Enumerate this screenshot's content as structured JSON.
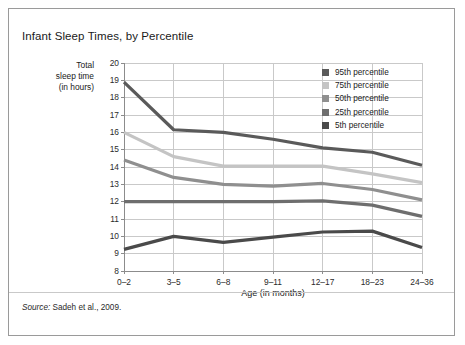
{
  "figure": {
    "title": "Infant Sleep Times, by Percentile",
    "source_label": "Source:",
    "source_text": " Sadeh et al., 2009."
  },
  "axes": {
    "y_title_lines": [
      "Total",
      "sleep time",
      "(in hours)"
    ],
    "x_title": "Age (in months)",
    "y_ticks": [
      "20",
      "19",
      "18",
      "17",
      "16",
      "15",
      "14",
      "13",
      "12",
      "11",
      "10",
      "9",
      "8"
    ],
    "x_ticks": [
      "0–2",
      "3–5",
      "6–8",
      "9–11",
      "12–17",
      "18–23",
      "24–36"
    ]
  },
  "colors": {
    "frame": "#9a9a9a",
    "grid": "#c9c9c9",
    "axis": "#8c8c8c",
    "text": "#1a1a1a",
    "p95": "#5a5a5a",
    "p75": "#c4c4c4",
    "p50": "#8f8f8f",
    "p25": "#6e6e6e",
    "p5": "#4a4a4a"
  },
  "chart_data": {
    "type": "line",
    "title": "Infant Sleep Times, by Percentile",
    "xlabel": "Age (in months)",
    "ylabel": "Total sleep time (in hours)",
    "categories": [
      "0–2",
      "3–5",
      "6–8",
      "9–11",
      "12–17",
      "18–23",
      "24–36"
    ],
    "ylim": [
      8,
      20
    ],
    "ytick_step": 1,
    "grid": true,
    "legend_position": "top-right",
    "series": [
      {
        "name": "95th percentile",
        "color": "#5a5a5a",
        "values": [
          18.9,
          16.15,
          16.0,
          15.6,
          15.1,
          14.85,
          14.1
        ]
      },
      {
        "name": "75th percentile",
        "color": "#c4c4c4",
        "values": [
          16.0,
          14.6,
          14.05,
          14.05,
          14.05,
          13.6,
          13.1
        ]
      },
      {
        "name": "50th percentile",
        "color": "#8f8f8f",
        "values": [
          14.4,
          13.4,
          13.0,
          12.9,
          13.05,
          12.7,
          12.1
        ]
      },
      {
        "name": "25th percentile",
        "color": "#6e6e6e",
        "values": [
          12.0,
          12.0,
          12.0,
          12.0,
          12.05,
          11.8,
          11.15
        ]
      },
      {
        "name": "5th percentile",
        "color": "#4a4a4a",
        "values": [
          9.25,
          10.0,
          9.65,
          9.95,
          10.25,
          10.3,
          9.35
        ]
      }
    ]
  },
  "legend": {
    "items": [
      {
        "label": "95th percentile",
        "color": "#5a5a5a"
      },
      {
        "label": "75th percentile",
        "color": "#c4c4c4"
      },
      {
        "label": "50th percentile",
        "color": "#8f8f8f"
      },
      {
        "label": "25th percentile",
        "color": "#6e6e6e"
      },
      {
        "label": "5th percentile",
        "color": "#4a4a4a"
      }
    ]
  }
}
